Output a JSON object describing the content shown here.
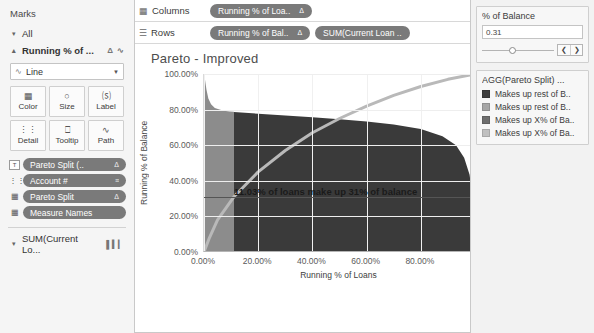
{
  "marks": {
    "title": "Marks",
    "all_label": "All",
    "active_card_label": "Running % of ...",
    "active_card_icons": [
      "delta-icon",
      "line-icon"
    ],
    "mark_type": "Line",
    "buttons": [
      {
        "label": "Color",
        "icon": "color-palette-icon",
        "glyph": "▒"
      },
      {
        "label": "Size",
        "icon": "size-icon",
        "glyph": "◯"
      },
      {
        "label": "Label",
        "icon": "label-icon",
        "glyph": "T"
      },
      {
        "label": "Detail",
        "icon": "detail-icon",
        "glyph": "∷"
      },
      {
        "label": "Tooltip",
        "icon": "tooltip-icon",
        "glyph": "▭"
      },
      {
        "label": "Path",
        "icon": "path-icon",
        "glyph": "∿"
      }
    ],
    "pills": [
      {
        "label": "Pareto Split (..",
        "end": "Δ",
        "icon": "label-pill-icon",
        "glyph": "T"
      },
      {
        "label": "Account #",
        "end": "≡",
        "icon": "detail-pill-icon",
        "glyph": "∷"
      },
      {
        "label": "Pareto Split",
        "end": "Δ",
        "icon": "color-pill-icon",
        "glyph": "▒"
      },
      {
        "label": "Measure Names",
        "end": "",
        "icon": "color-pill-icon",
        "glyph": "▒"
      }
    ],
    "sum_card_label": "SUM(Current Lo...",
    "sum_card_icon": "bar-chart-icon"
  },
  "shelves": {
    "columns_label": "Columns",
    "columns_icon": "columns-icon",
    "columns_pills": [
      {
        "label": "Running % of Loa..",
        "end": "Δ"
      }
    ],
    "rows_label": "Rows",
    "rows_icon": "rows-icon",
    "rows_pills": [
      {
        "label": "Running % of Bal..",
        "end": "Δ"
      },
      {
        "label": "SUM(Current Loan ..",
        "end": ""
      }
    ]
  },
  "viz": {
    "title": "Pareto - Improved",
    "annotation": "11.03% of loans make up 31% of balance"
  },
  "right_panel": {
    "filter": {
      "title": "% of Balance",
      "value": "0.31",
      "slider_position_pct": 38,
      "prev_icon": "❮",
      "next_icon": "❯"
    },
    "legend": {
      "title": "AGG(Pareto Split) ...",
      "items": [
        {
          "label": "Makes up rest of B..",
          "color": "#3f3f3f"
        },
        {
          "label": "Makes up rest of B..",
          "color": "#a6a6a6"
        },
        {
          "label": "Makes up X% of Ba..",
          "color": "#6e6e6e"
        },
        {
          "label": "Makes up X% of Ba..",
          "color": "#c0c0c0"
        }
      ]
    }
  },
  "chart_data": {
    "type": "area",
    "title": "Pareto - Improved",
    "xlabel": "Running % of Loans",
    "ylabel": "Running % of Balance",
    "y2label": "Current Loan Balance",
    "xlim": [
      0,
      100
    ],
    "xticks": [
      "0.00%",
      "20.00%",
      "40.00%",
      "60.00%",
      "80.00%"
    ],
    "xtick_values": [
      0,
      20,
      40,
      60,
      80
    ],
    "ylim": [
      0,
      100
    ],
    "yticks": [
      "0.00%",
      "20.00%",
      "40.00%",
      "60.00%",
      "80.00%",
      "100.00%"
    ],
    "ytick_values": [
      0,
      20,
      40,
      60,
      80,
      100
    ],
    "y2_scale": "log",
    "y2ticks": [
      "1",
      "10",
      "100",
      "1,000",
      "10,000",
      "100,000",
      "1,000,000"
    ],
    "y2tick_values": [
      1,
      10,
      100,
      1000,
      10000,
      100000,
      1000000
    ],
    "grid": true,
    "legend_position": "right",
    "annotations": [
      {
        "text": "11.03% of loans make up 31% of balance",
        "x": 11.03,
        "y": 31
      }
    ],
    "series": [
      {
        "name": "Current Loan Balance (Makes up X% of Balance)",
        "type": "area",
        "color": "#8c8c8c",
        "axis": "y2",
        "x": [
          0,
          0.4,
          0.9,
          1.6,
          2.6,
          4.0,
          6.0,
          8.0,
          9.5,
          11.03
        ],
        "values": [
          1000000,
          620000,
          300000,
          150000,
          96000,
          72000,
          62000,
          57000,
          54500,
          53000
        ]
      },
      {
        "name": "Current Loan Balance (Makes up rest of Balance)",
        "type": "area",
        "color": "#3a3a3a",
        "axis": "y2",
        "x": [
          11.03,
          20,
          30,
          40,
          50,
          60,
          70,
          80,
          88,
          93,
          96,
          98,
          99.5,
          100
        ],
        "values": [
          52000,
          46000,
          40000,
          35000,
          30000,
          25000,
          20000,
          14000,
          8000,
          4000,
          1500,
          400,
          40,
          1
        ]
      },
      {
        "name": "Running % of Balance",
        "type": "line",
        "color": "#b9b9b9",
        "axis": "y1",
        "x": [
          0,
          2,
          5,
          11.03,
          20,
          30,
          40,
          50,
          60,
          70,
          80,
          90,
          100
        ],
        "values": [
          0,
          8,
          18,
          31,
          45,
          57,
          67,
          75,
          82,
          88,
          93,
          97,
          100
        ]
      }
    ]
  }
}
